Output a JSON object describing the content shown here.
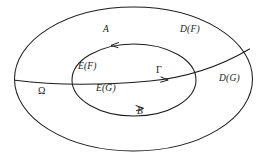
{
  "figure": {
    "type": "mathematical-set-diagram",
    "background_color": "#ffffff",
    "stroke_color": "#1d1d1d",
    "width": 266,
    "height": 156,
    "labels": [
      {
        "id": "A",
        "text": "A",
        "x": 105,
        "y": 30,
        "style": "italic"
      },
      {
        "id": "DF",
        "text": "D(F)",
        "x": 182,
        "y": 30,
        "style": "italic"
      },
      {
        "id": "EF",
        "text": "E(F)",
        "x": 80,
        "y": 67,
        "style": "italic"
      },
      {
        "id": "Gamma",
        "text": "Γ",
        "x": 158,
        "y": 70,
        "style": "greek"
      },
      {
        "id": "DG",
        "text": "D(G)",
        "x": 222,
        "y": 79,
        "style": "italic"
      },
      {
        "id": "Omega",
        "text": "Ω",
        "x": 41,
        "y": 91,
        "style": "greek"
      },
      {
        "id": "EG",
        "text": "E(G)",
        "x": 98,
        "y": 89,
        "style": "italic"
      },
      {
        "id": "B",
        "text": "B",
        "x": 139,
        "y": 112,
        "style": "italic"
      }
    ],
    "shapes": {
      "outer_ellipse": {
        "cx": 133.5,
        "cy": 79,
        "rx": 119,
        "ry": 72
      },
      "inner_ellipse": {
        "cx": 134,
        "cy": 80,
        "rx": 62,
        "ry": 36
      },
      "gamma_curve": {
        "from_x": 15,
        "from_y": 80,
        "to_x": 250,
        "to_y": 50
      }
    },
    "arrows": [
      {
        "id": "arrow-A",
        "on": "inner-ellipse-top",
        "direction": "leftward",
        "x": 114,
        "y": 45
      },
      {
        "id": "arrow-B",
        "on": "inner-ellipse-bottom",
        "direction": "rightward",
        "x": 141,
        "y": 108
      },
      {
        "id": "arrow-gamma",
        "on": "gamma-curve",
        "direction": "rightward",
        "x": 166,
        "y": 79
      }
    ]
  }
}
